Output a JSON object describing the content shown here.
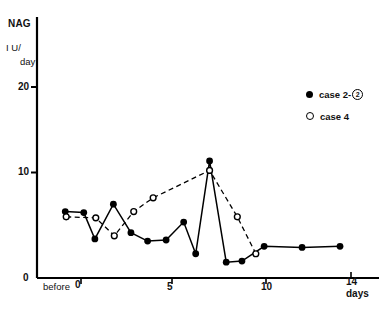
{
  "axes": {
    "y_title": "NAG",
    "y_unit_line1": "I U/",
    "y_unit_line2": "day",
    "x_title": "days",
    "ytick_20": "20",
    "ytick_10": "10",
    "ytick_0": "0",
    "xtick_before": "before",
    "xtick_0": "0",
    "xtick_5": "5",
    "xtick_10": "10",
    "xtick_14": "14"
  },
  "legend": {
    "items": [
      {
        "marker": "filled-circle-icon",
        "label": "case 2-",
        "suffix": "2"
      },
      {
        "marker": "open-circle-icon",
        "label": "case 4",
        "suffix": ""
      }
    ]
  },
  "chart_data": {
    "type": "line",
    "title": "",
    "xlabel": "days",
    "ylabel": "NAG  I U/day",
    "xlim": [
      -1.4,
      15.2
    ],
    "ylim": [
      0,
      21.5
    ],
    "yticks": [
      0,
      10,
      20
    ],
    "xticks": [
      0,
      5,
      10,
      14
    ],
    "x_special_tick": "before",
    "grid": false,
    "legend_position": "upper-right",
    "series": [
      {
        "name": "case 2-②",
        "marker": "filled-circle",
        "linestyle": "solid",
        "color": "#000000",
        "points": [
          {
            "x": -0.85,
            "y": 6.3,
            "label": "before"
          },
          {
            "x": 0.15,
            "y": 6.2
          },
          {
            "x": 0.75,
            "y": 3.7
          },
          {
            "x": 1.75,
            "y": 7.0
          },
          {
            "x": 2.7,
            "y": 4.3
          },
          {
            "x": 3.6,
            "y": 3.5
          },
          {
            "x": 4.6,
            "y": 3.6
          },
          {
            "x": 5.55,
            "y": 5.3
          },
          {
            "x": 6.2,
            "y": 2.3
          },
          {
            "x": 6.95,
            "y": 11.1
          },
          {
            "x": 7.85,
            "y": 1.5
          },
          {
            "x": 8.7,
            "y": 1.6
          },
          {
            "x": 9.9,
            "y": 3.0
          },
          {
            "x": 11.95,
            "y": 2.9
          },
          {
            "x": 14.0,
            "y": 3.0
          }
        ]
      },
      {
        "name": "case 4",
        "marker": "open-circle",
        "linestyle": "dashed",
        "color": "#000000",
        "points": [
          {
            "x": -0.8,
            "y": 5.8,
            "label": "before"
          },
          {
            "x": 0.8,
            "y": 5.7
          },
          {
            "x": 1.8,
            "y": 4.0
          },
          {
            "x": 2.85,
            "y": 6.3
          },
          {
            "x": 3.9,
            "y": 7.6
          },
          {
            "x": 6.95,
            "y": 10.2
          },
          {
            "x": 8.45,
            "y": 5.8
          },
          {
            "x": 9.45,
            "y": 2.3
          }
        ]
      }
    ]
  }
}
